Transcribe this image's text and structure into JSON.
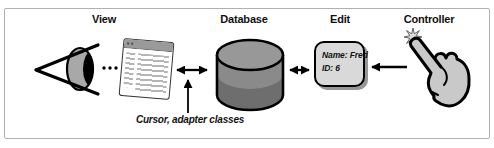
{
  "figure": {
    "labels": {
      "view": "View",
      "database": "Database",
      "edit": "Edit",
      "controller": "Controller"
    },
    "edit_box": {
      "name_line": "Name: Fred",
      "id_line": "ID: 6"
    },
    "caption": "Cursor, adapter classes",
    "icons": {
      "view": "eye-icon",
      "view_widget": "browser-window-icon",
      "database": "database-cylinder-icon",
      "controller": "pointing-hand-icon",
      "controller_accent": "starburst-icon"
    },
    "connections": [
      {
        "from": "browser-window",
        "to": "database",
        "style": "double-headed-arrow"
      },
      {
        "from": "database",
        "to": "edit-box",
        "style": "double-headed-arrow"
      },
      {
        "from": "controller",
        "to": "edit-box",
        "style": "single-arrow-left"
      },
      {
        "from": "caption",
        "to": "view-database-arrow",
        "style": "pointer-arrow-up"
      }
    ],
    "colors": {
      "background": "#ffffff",
      "frame_border": "#b0b0b0",
      "line": "#000000",
      "cylinder_top": "#989898",
      "cylinder_body": "#8a8a8a",
      "cylinder_shade": "#6e6e6e",
      "edit_fill": "#d9d9d9",
      "edit_shadow": "#979797",
      "hand_fill": "#c9c9c9",
      "iris": "#a8a8a8",
      "titlebar": "#9a9a9a"
    }
  }
}
